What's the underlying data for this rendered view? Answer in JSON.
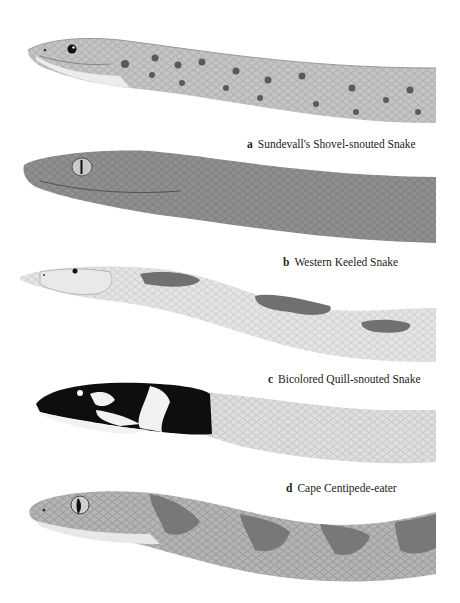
{
  "plate": {
    "illustrations": [
      {
        "letter": "a",
        "name": "Sundevall's Shovel-snouted Snake",
        "color": "#a8a8a8"
      },
      {
        "letter": "b",
        "name": "Western Keeled Snake",
        "color": "#8c8c8c"
      },
      {
        "letter": "c",
        "name": "Bicolored Quill-snouted Snake",
        "color": "#d9d9d9"
      },
      {
        "letter": "d",
        "name": "Cape Centipede-eater",
        "color": "#9a9a9a"
      }
    ]
  }
}
